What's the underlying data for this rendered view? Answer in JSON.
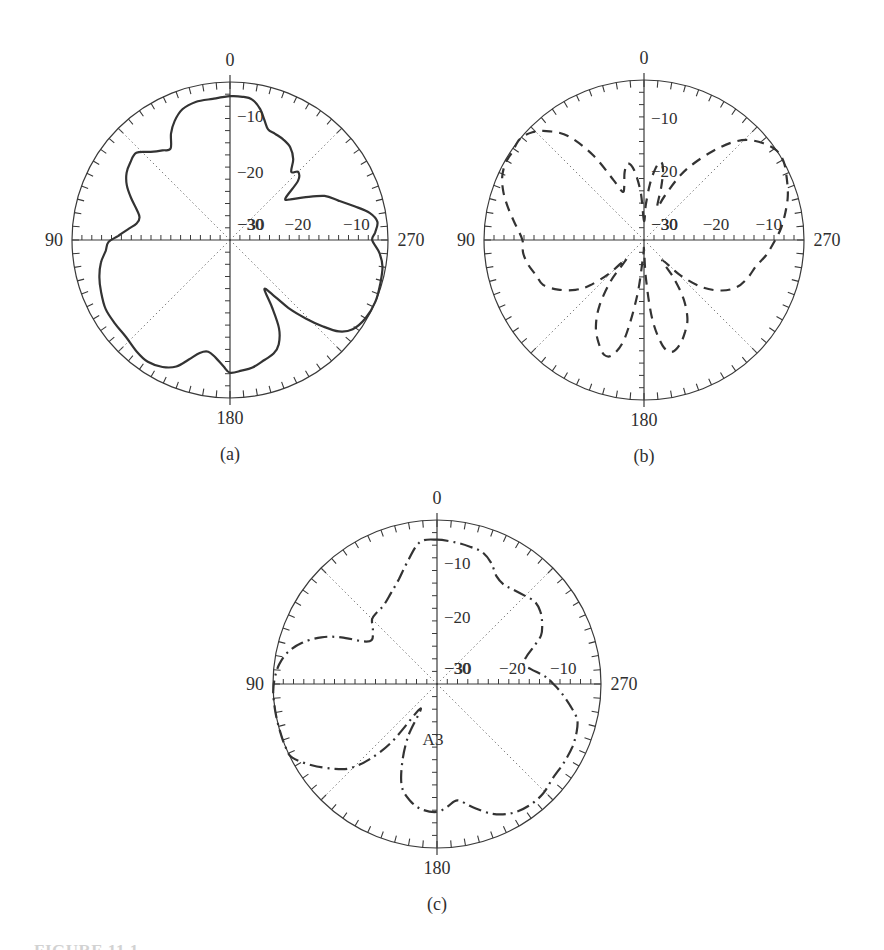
{
  "page": {
    "background": "#ffffff",
    "ink_color": "#3a3a3a",
    "curve_color": "#333333",
    "figure_caption_fragment": "FIGURE 11.1"
  },
  "chart_data": [
    {
      "type": "line",
      "subtype": "polar-radiation-pattern",
      "caption": "(a)",
      "line_style": "solid",
      "angle_unit": "degrees",
      "angle_convention": "0 at top, increasing counterclockwise (90 left, 180 bottom, 270 right)",
      "rim_tick_step_degrees": 5,
      "angle_labels": [
        "0",
        "90",
        "180",
        "270"
      ],
      "radial_labels_vertical": [
        {
          "text": "−10",
          "r": 0.785
        },
        {
          "text": "−20",
          "r": 0.43
        },
        {
          "text": "−30",
          "r": 0.1
        }
      ],
      "radial_labels_horizontal": [
        {
          "text": "−30",
          "r": 0.135
        },
        {
          "text": "−20",
          "r": 0.43
        },
        {
          "text": "−10",
          "r": 0.8
        }
      ],
      "r_unit": "fraction of outer circle radius (outer = 0 dB)",
      "points_angle_rfrac": [
        [
          0,
          0.91
        ],
        [
          7,
          0.9
        ],
        [
          14,
          0.9
        ],
        [
          20,
          0.88
        ],
        [
          25,
          0.83
        ],
        [
          29,
          0.77
        ],
        [
          33,
          0.69
        ],
        [
          37,
          0.71
        ],
        [
          42,
          0.75
        ],
        [
          47,
          0.81
        ],
        [
          52,
          0.8
        ],
        [
          57,
          0.78
        ],
        [
          62,
          0.74
        ],
        [
          67,
          0.68
        ],
        [
          72,
          0.62
        ],
        [
          76,
          0.59
        ],
        [
          80,
          0.6
        ],
        [
          84,
          0.65
        ],
        [
          88,
          0.71
        ],
        [
          91,
          0.77
        ],
        [
          95,
          0.79
        ],
        [
          100,
          0.83
        ],
        [
          106,
          0.86
        ],
        [
          112,
          0.88
        ],
        [
          119,
          0.9
        ],
        [
          126,
          0.9
        ],
        [
          133,
          0.9
        ],
        [
          140,
          0.92
        ],
        [
          146,
          0.93
        ],
        [
          152,
          0.91
        ],
        [
          157,
          0.87
        ],
        [
          161,
          0.8
        ],
        [
          165,
          0.74
        ],
        [
          169,
          0.72
        ],
        [
          173,
          0.75
        ],
        [
          177,
          0.8
        ],
        [
          180,
          0.84
        ],
        [
          185,
          0.83
        ],
        [
          190,
          0.82
        ],
        [
          196,
          0.79
        ],
        [
          201,
          0.77
        ],
        [
          205,
          0.73
        ],
        [
          209,
          0.64
        ],
        [
          212,
          0.5
        ],
        [
          215,
          0.38
        ],
        [
          218,
          0.44
        ],
        [
          221,
          0.58
        ],
        [
          224,
          0.69
        ],
        [
          227,
          0.8
        ],
        [
          230,
          0.9
        ],
        [
          234,
          0.96
        ],
        [
          240,
          0.99
        ],
        [
          247,
          1.0
        ],
        [
          254,
          0.99
        ],
        [
          260,
          0.98
        ],
        [
          265,
          0.95
        ],
        [
          270,
          0.9
        ],
        [
          273,
          0.92
        ],
        [
          277,
          0.94
        ],
        [
          281,
          0.9
        ],
        [
          285,
          0.82
        ],
        [
          290,
          0.73
        ],
        [
          295,
          0.66
        ],
        [
          300,
          0.54
        ],
        [
          304,
          0.46
        ],
        [
          307,
          0.44
        ],
        [
          311,
          0.57
        ],
        [
          315,
          0.61
        ],
        [
          318,
          0.58
        ],
        [
          322,
          0.65
        ],
        [
          327,
          0.7
        ],
        [
          332,
          0.72
        ],
        [
          337,
          0.73
        ],
        [
          341,
          0.74
        ],
        [
          344,
          0.79
        ],
        [
          347,
          0.85
        ],
        [
          351,
          0.9
        ],
        [
          355,
          0.91
        ]
      ]
    },
    {
      "type": "line",
      "subtype": "polar-radiation-pattern",
      "caption": "(b)",
      "line_style": "dashed",
      "angle_unit": "degrees",
      "angle_convention": "0 at top, increasing counterclockwise (90 left, 180 bottom, 270 right)",
      "rim_tick_step_degrees": 5,
      "angle_labels": [
        "0",
        "90",
        "180",
        "270"
      ],
      "radial_labels_vertical": [
        {
          "text": "−10",
          "r": 0.76
        },
        {
          "text": "−20",
          "r": 0.43
        },
        {
          "text": "−30",
          "r": 0.1
        }
      ],
      "radial_labels_horizontal": [
        {
          "text": "−30",
          "r": 0.13
        },
        {
          "text": "−20",
          "r": 0.45
        },
        {
          "text": "−10",
          "r": 0.78
        }
      ],
      "r_unit": "fraction of outer circle radius (outer = 0 dB)",
      "points_angle_rfrac": [
        [
          0,
          0.12
        ],
        [
          4,
          0.3
        ],
        [
          8,
          0.44
        ],
        [
          12,
          0.49
        ],
        [
          16,
          0.44
        ],
        [
          20,
          0.36
        ],
        [
          24,
          0.33
        ],
        [
          27,
          0.42
        ],
        [
          31,
          0.62
        ],
        [
          36,
          0.8
        ],
        [
          41,
          0.9
        ],
        [
          46,
          0.97
        ],
        [
          51,
          1.0
        ],
        [
          56,
          0.99
        ],
        [
          61,
          0.99
        ],
        [
          66,
          0.97
        ],
        [
          71,
          0.93
        ],
        [
          76,
          0.88
        ],
        [
          82,
          0.82
        ],
        [
          90,
          0.76
        ],
        [
          96,
          0.76
        ],
        [
          102,
          0.74
        ],
        [
          108,
          0.71
        ],
        [
          114,
          0.69
        ],
        [
          120,
          0.62
        ],
        [
          126,
          0.53
        ],
        [
          130,
          0.44
        ],
        [
          134,
          0.3
        ],
        [
          137,
          0.16
        ],
        [
          141,
          0.33
        ],
        [
          146,
          0.5
        ],
        [
          151,
          0.62
        ],
        [
          156,
          0.7
        ],
        [
          161,
          0.76
        ],
        [
          165,
          0.74
        ],
        [
          169,
          0.62
        ],
        [
          173,
          0.35
        ],
        [
          177,
          0.1
        ],
        [
          180,
          0.06
        ],
        [
          183,
          0.25
        ],
        [
          186,
          0.5
        ],
        [
          190,
          0.67
        ],
        [
          194,
          0.72
        ],
        [
          199,
          0.69
        ],
        [
          204,
          0.63
        ],
        [
          209,
          0.56
        ],
        [
          214,
          0.44
        ],
        [
          218,
          0.3
        ],
        [
          222,
          0.17
        ],
        [
          226,
          0.32
        ],
        [
          231,
          0.47
        ],
        [
          237,
          0.58
        ],
        [
          243,
          0.65
        ],
        [
          250,
          0.69
        ],
        [
          257,
          0.72
        ],
        [
          263,
          0.77
        ],
        [
          270,
          0.82
        ],
        [
          275,
          0.86
        ],
        [
          281,
          0.9
        ],
        [
          287,
          0.94
        ],
        [
          293,
          0.97
        ],
        [
          299,
          1.0
        ],
        [
          304,
          1.0
        ],
        [
          309,
          0.96
        ],
        [
          314,
          0.9
        ],
        [
          318,
          0.82
        ],
        [
          322,
          0.71
        ],
        [
          327,
          0.57
        ],
        [
          331,
          0.45
        ],
        [
          335,
          0.3
        ],
        [
          338,
          0.22
        ],
        [
          342,
          0.35
        ],
        [
          345,
          0.46
        ],
        [
          348,
          0.5
        ],
        [
          351,
          0.45
        ],
        [
          354,
          0.35
        ],
        [
          357,
          0.22
        ]
      ]
    },
    {
      "type": "line",
      "subtype": "polar-radiation-pattern",
      "caption": "(c)",
      "line_style": "dash-dot",
      "angle_unit": "degrees",
      "angle_convention": "0 at top, increasing counterclockwise (90 left, 180 bottom, 270 right)",
      "rim_tick_step_degrees": 5,
      "angle_labels": [
        "0",
        "90",
        "180",
        "270"
      ],
      "radial_labels_vertical": [
        {
          "text": "−10",
          "r": 0.74
        },
        {
          "text": "−20",
          "r": 0.41
        },
        {
          "text": "−30",
          "r": 0.1
        }
      ],
      "radial_labels_horizontal": [
        {
          "text": "−30",
          "r": 0.13
        },
        {
          "text": "−20",
          "r": 0.46
        },
        {
          "text": "−10",
          "r": 0.77
        }
      ],
      "annotation": {
        "text": "A3",
        "angle": 180,
        "r": 0.335
      },
      "r_unit": "fraction of outer circle radius (outer = 0 dB)",
      "points_angle_rfrac": [
        [
          0,
          0.88
        ],
        [
          7,
          0.87
        ],
        [
          14,
          0.76
        ],
        [
          20,
          0.68
        ],
        [
          27,
          0.62
        ],
        [
          34,
          0.58
        ],
        [
          40,
          0.57
        ],
        [
          45,
          0.56
        ],
        [
          50,
          0.51
        ],
        [
          56,
          0.48
        ],
        [
          60,
          0.52
        ],
        [
          64,
          0.65
        ],
        [
          68,
          0.76
        ],
        [
          73,
          0.86
        ],
        [
          78,
          0.93
        ],
        [
          83,
          0.97
        ],
        [
          88,
          0.99
        ],
        [
          93,
          1.0
        ],
        [
          100,
          1.0
        ],
        [
          107,
          1.0
        ],
        [
          113,
          1.0
        ],
        [
          117,
          0.99
        ],
        [
          123,
          0.91
        ],
        [
          129,
          0.82
        ],
        [
          134,
          0.74
        ],
        [
          138,
          0.62
        ],
        [
          142,
          0.45
        ],
        [
          146,
          0.18
        ],
        [
          151,
          0.36
        ],
        [
          156,
          0.52
        ],
        [
          161,
          0.66
        ],
        [
          167,
          0.73
        ],
        [
          173,
          0.77
        ],
        [
          180,
          0.78
        ],
        [
          185,
          0.75
        ],
        [
          190,
          0.72
        ],
        [
          196,
          0.78
        ],
        [
          203,
          0.86
        ],
        [
          210,
          0.91
        ],
        [
          217,
          0.93
        ],
        [
          224,
          0.93
        ],
        [
          231,
          0.91
        ],
        [
          238,
          0.91
        ],
        [
          245,
          0.91
        ],
        [
          251,
          0.9
        ],
        [
          256,
          0.88
        ],
        [
          261,
          0.82
        ],
        [
          266,
          0.76
        ],
        [
          270,
          0.71
        ],
        [
          274,
          0.66
        ],
        [
          279,
          0.58
        ],
        [
          283,
          0.54
        ],
        [
          287,
          0.57
        ],
        [
          291,
          0.63
        ],
        [
          295,
          0.7
        ],
        [
          300,
          0.74
        ],
        [
          305,
          0.77
        ],
        [
          310,
          0.78
        ],
        [
          315,
          0.76
        ],
        [
          321,
          0.74
        ],
        [
          326,
          0.73
        ],
        [
          331,
          0.75
        ],
        [
          336,
          0.81
        ],
        [
          341,
          0.85
        ],
        [
          346,
          0.86
        ],
        [
          352,
          0.87
        ]
      ]
    }
  ]
}
